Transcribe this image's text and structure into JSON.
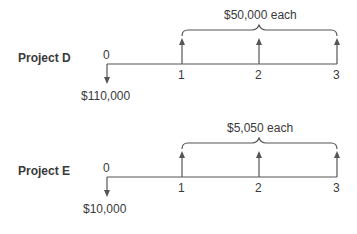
{
  "diagrams": [
    {
      "project_label": "Project D",
      "period_labels": [
        "0",
        "1",
        "2",
        "3"
      ],
      "outflow_label": "$110,000",
      "inflow_label": "$50,000 each"
    },
    {
      "project_label": "Project E",
      "period_labels": [
        "0",
        "1",
        "2",
        "3"
      ],
      "outflow_label": "$10,000",
      "inflow_label": "$5,050 each"
    }
  ],
  "colors": {
    "ink": "#3a3a3a",
    "lines": "#555555"
  }
}
